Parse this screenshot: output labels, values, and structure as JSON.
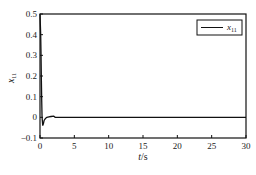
{
  "chart_data": {
    "type": "line",
    "title": "",
    "xlabel": "t/s",
    "ylabel": "x11",
    "xlim": [
      0,
      30
    ],
    "ylim": [
      -0.1,
      0.5
    ],
    "xticks": [
      0,
      5,
      10,
      15,
      20,
      25,
      30
    ],
    "yticks": [
      -0.1,
      0,
      0.1,
      0.2,
      0.3,
      0.4,
      0.5
    ],
    "xtick_labels": [
      "0",
      "5",
      "10",
      "15",
      "20",
      "25",
      "30"
    ],
    "ytick_labels": [
      "-0.1",
      "0",
      "0.1",
      "0.2",
      "0.3",
      "0.4",
      "0.5"
    ],
    "grid": false,
    "legend_position": "upper right",
    "series": [
      {
        "name": "x11",
        "color": "#111111",
        "x": [
          0,
          0.05,
          0.1,
          0.15,
          0.2,
          0.25,
          0.3,
          0.4,
          0.5,
          0.6,
          0.8,
          1.0,
          1.3,
          1.6,
          2.0,
          2.2,
          2.5,
          3.0,
          5,
          10,
          15,
          20,
          25,
          30
        ],
        "y": [
          0.5,
          0.45,
          0.4,
          0.3,
          0.18,
          0.08,
          0.0,
          -0.04,
          -0.03,
          -0.015,
          -0.005,
          0.0,
          0.002,
          0.004,
          0.006,
          0.0,
          0.0,
          0.0,
          0.0,
          0.0,
          0.0,
          0.0,
          0.0,
          0.0
        ]
      }
    ]
  },
  "legend": {
    "label": "x",
    "subscript": "11"
  },
  "axes": {
    "xlabel_italic": "t",
    "xlabel_unit": "/s",
    "ylabel_main": "x",
    "ylabel_sub": "11"
  }
}
